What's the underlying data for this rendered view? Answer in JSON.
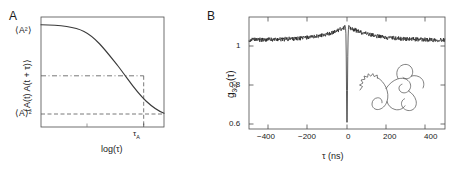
{
  "figure": {
    "panel_a_letter": "A",
    "panel_b_letter": "B"
  },
  "panel_a": {
    "name": "autocorrelation-schematic",
    "ylabel": "⟨A(t) A(t + τ)⟩",
    "xlabel": "log(τ)",
    "upper_level_label": "⟨A²⟩",
    "lower_level_label": "⟨A⟩²",
    "tau_marker_label": "τ",
    "tau_marker_sub": "A",
    "description": "Sigmoidal decay of an autocorrelation function from the mean-square value to the square of the mean; dashed guides mark the correlation time.",
    "has_box_frame": true
  },
  "panel_b": {
    "name": "photon-correlation-measurement",
    "ylabel_main": "g",
    "ylabel_sub": "300",
    "ylabel_arg": "(τ)",
    "ylabel_full": "g₃₀₀ (τ)",
    "xlabel": "τ (ns)",
    "inset_name": "polymer-coil-sketch",
    "has_box_frame": true
  },
  "chart_data": [
    {
      "type": "line",
      "name": "panel-a-autocorrelation",
      "title": "",
      "xlabel": "log(τ)",
      "ylabel": "⟨A(t) A(t + τ)⟩",
      "xlim": [
        0,
        10
      ],
      "ylim": [
        0,
        1
      ],
      "grid": false,
      "legend": "none",
      "y_annotations": [
        {
          "label": "⟨A²⟩",
          "value": 0.92,
          "style": "text-left"
        },
        {
          "label": "⟨A⟩²",
          "value": 0.12,
          "style": "text-left-dashed"
        },
        {
          "label": "midpoint",
          "value": 0.52,
          "style": "dash-dot"
        }
      ],
      "x_annotations": [
        {
          "label": "τ_A",
          "value": 6.35,
          "style": "dashed-vertical"
        }
      ],
      "x": [
        0,
        0.5,
        1,
        1.5,
        2,
        2.5,
        3,
        3.5,
        4,
        4.5,
        5,
        5.5,
        6,
        6.35,
        6.5,
        7,
        7.5,
        8,
        8.5,
        9,
        9.5,
        10
      ],
      "values": [
        0.92,
        0.919,
        0.917,
        0.913,
        0.906,
        0.894,
        0.875,
        0.846,
        0.805,
        0.75,
        0.683,
        0.61,
        0.537,
        0.52,
        0.47,
        0.39,
        0.3,
        0.23,
        0.175,
        0.145,
        0.128,
        0.12
      ]
    },
    {
      "type": "line",
      "name": "panel-b-correlation-data",
      "title": "",
      "xlabel": "τ (ns)",
      "ylabel": "g₃₀₀ (τ)",
      "xlim": [
        -500,
        500
      ],
      "ylim": [
        0.55,
        1.18
      ],
      "xticks": [
        -400,
        -200,
        0,
        200,
        400
      ],
      "xticklabels": [
        "−400",
        "−200",
        "0",
        "200",
        "400"
      ],
      "yticks": [
        1,
        0.8,
        0.6
      ],
      "yticklabels": [
        "1",
        "0.8",
        "0.6"
      ],
      "grid": false,
      "legend": "none",
      "baseline_value": 1.05,
      "peak_value": 1.13,
      "dip_minimum": 0.56,
      "dip_width_ns": 6,
      "bunching_decay_ns": 120,
      "noise_amplitude": 0.012,
      "notes": "Noisy baseline near 1.05 with a bunching shoulder peaking at 1.13 around zero delay and a narrow antibunching dip at tau = 0."
    }
  ]
}
